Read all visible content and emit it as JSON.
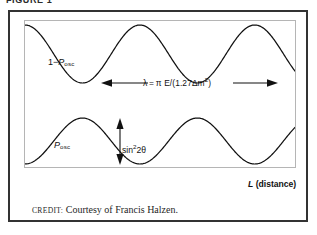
{
  "figure": {
    "caption": "FIGURE 1",
    "credit_label": "CREDIT:",
    "credit_text": "Courtesy of Francis Halzen."
  },
  "chart_data": {
    "type": "line",
    "title": "",
    "xlabel_main": "L",
    "xlabel_paren": "(distance)",
    "ylabel": "",
    "grid": false,
    "legend": "inline-curve-labels",
    "xlim": [
      0,
      2.35
    ],
    "ylim": [
      0,
      1
    ],
    "axis_units": "oscillation phase (periods)",
    "series": [
      {
        "name": "1 - P_osc",
        "label_main": "1−",
        "label_symbol": "P",
        "label_subscript": "osc",
        "formula": "1 - sin^2(2θ) sin^2(1.27 Δm^2 L / E)",
        "amplitude": 1.0,
        "baseline": 1.0,
        "direction": "starts at maximum",
        "x": [
          0.0,
          0.125,
          0.25,
          0.375,
          0.5,
          0.625,
          0.75,
          0.875,
          1.0,
          1.125,
          1.25,
          1.375,
          1.5,
          1.625,
          1.75,
          1.875,
          2.0,
          2.125,
          2.25,
          2.35
        ],
        "y": [
          1.0,
          0.854,
          0.5,
          0.146,
          0.0,
          0.146,
          0.5,
          0.854,
          1.0,
          0.854,
          0.5,
          0.146,
          0.0,
          0.146,
          0.5,
          0.854,
          1.0,
          0.962,
          0.75,
          0.56
        ]
      },
      {
        "name": "P_osc",
        "label_symbol": "P",
        "label_subscript": "osc",
        "formula": "sin^2(2θ) sin^2(1.27 Δm^2 L / E)",
        "amplitude": 1.0,
        "baseline": 0.0,
        "direction": "starts at minimum",
        "x": [
          0.0,
          0.125,
          0.25,
          0.375,
          0.5,
          0.625,
          0.75,
          0.875,
          1.0,
          1.125,
          1.25,
          1.375,
          1.5,
          1.625,
          1.75,
          1.875,
          2.0,
          2.125,
          2.25,
          2.35
        ],
        "y": [
          0.0,
          0.146,
          0.5,
          0.854,
          1.0,
          0.854,
          0.5,
          0.146,
          0.0,
          0.146,
          0.5,
          0.854,
          1.0,
          0.854,
          0.5,
          0.146,
          0.0,
          0.038,
          0.25,
          0.44
        ]
      }
    ],
    "annotations": [
      {
        "name": "wavelength",
        "kind": "double-headed-horizontal-arrow",
        "text_lambda": "λ",
        "text_equals": "=",
        "text_pi": "π",
        "text_energy": "E/(1.27",
        "text_delta": "Δ",
        "text_m": "m",
        "text_exponent": "2",
        "text_close": ")",
        "full_text": "λ = π E/(1.27Δm²)",
        "spans_periods": 1.0
      },
      {
        "name": "amplitude",
        "kind": "double-headed-vertical-arrow",
        "text_sin": "sin",
        "text_exponent": "2",
        "text_angle": "2θ",
        "full_text": "sin²2θ",
        "value": 1.0
      }
    ],
    "colors": {
      "curve": "#111111",
      "panel_border": "#b5b5b5",
      "figure_border": "#333333",
      "background": "#ffffff",
      "text": "#111111"
    }
  }
}
